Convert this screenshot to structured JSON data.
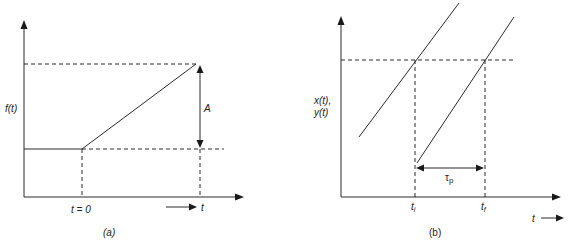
{
  "panel_a": {
    "caption": "(a)",
    "y_label": "f(t)",
    "amplitude_label": "A",
    "t0_label": "t = 0",
    "t_label": "t",
    "description": "Ramp input: constant level until t = 0, then linear rise by amplitude A"
  },
  "panel_b": {
    "caption": "(b)",
    "y_label_line1": "x(t),",
    "y_label_line2": "y(t)",
    "ti_label": "t",
    "ti_sub": "i",
    "tf_label": "t",
    "tf_sub": "f",
    "tau_label": "τ",
    "tau_sub": "p",
    "t_label": "t",
    "description": "Two parallel ramps x(t) and y(t) separated by time lag τp between ti and tf"
  },
  "colors": {
    "line": "#2a2a2a",
    "background": "#ffffff"
  }
}
